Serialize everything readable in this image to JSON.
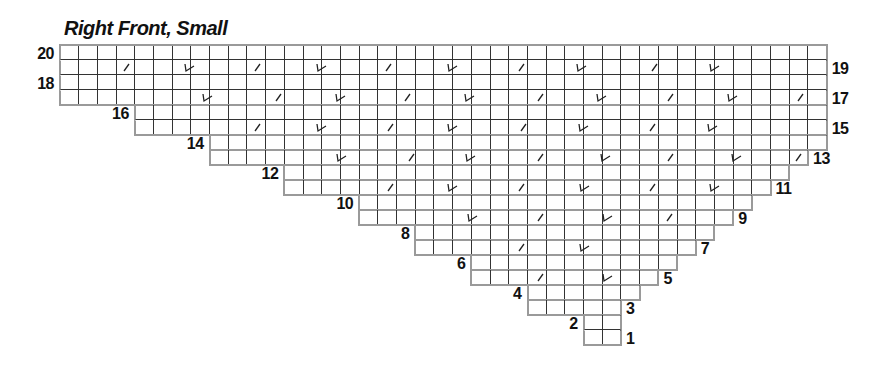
{
  "title": "Right Front, Small",
  "colors": {
    "grid_line": "#333333",
    "outline": "#9a9a9a",
    "symbol": "#222222",
    "text": "#111111"
  },
  "grid": {
    "origin_x": 60,
    "origin_y": 45,
    "cell_w": 18.7,
    "cell_h": 15,
    "columns": 41,
    "rows_count": 20,
    "rows": [
      {
        "row": 20,
        "start": 0,
        "end": 41,
        "label": "20",
        "label_side": "left"
      },
      {
        "row": 19,
        "start": 0,
        "end": 41,
        "label": "19",
        "label_side": "right"
      },
      {
        "row": 18,
        "start": 0,
        "end": 41,
        "label": "18",
        "label_side": "left"
      },
      {
        "row": 17,
        "start": 0,
        "end": 41,
        "label": "17",
        "label_side": "right"
      },
      {
        "row": 16,
        "start": 4,
        "end": 41,
        "label": "16",
        "label_side": "left"
      },
      {
        "row": 15,
        "start": 4,
        "end": 41,
        "label": "15",
        "label_side": "right"
      },
      {
        "row": 14,
        "start": 8,
        "end": 41,
        "label": "14",
        "label_side": "left"
      },
      {
        "row": 13,
        "start": 8,
        "end": 40,
        "label": "13",
        "label_side": "right"
      },
      {
        "row": 12,
        "start": 12,
        "end": 39,
        "label": "12",
        "label_side": "left"
      },
      {
        "row": 11,
        "start": 12,
        "end": 38,
        "label": "11",
        "label_side": "right"
      },
      {
        "row": 10,
        "start": 16,
        "end": 37,
        "label": "10",
        "label_side": "left"
      },
      {
        "row": 9,
        "start": 16,
        "end": 36,
        "label": "9",
        "label_side": "right"
      },
      {
        "row": 8,
        "start": 19,
        "end": 35,
        "label": "8",
        "label_side": "left"
      },
      {
        "row": 7,
        "start": 19,
        "end": 34,
        "label": "7",
        "label_side": "right"
      },
      {
        "row": 6,
        "start": 22,
        "end": 33,
        "label": "6",
        "label_side": "left"
      },
      {
        "row": 5,
        "start": 22,
        "end": 32,
        "label": "5",
        "label_side": "right"
      },
      {
        "row": 4,
        "start": 25,
        "end": 31,
        "label": "4",
        "label_side": "left"
      },
      {
        "row": 3,
        "start": 25,
        "end": 30,
        "label": "3",
        "label_side": "right"
      },
      {
        "row": 2,
        "start": 28,
        "end": 30,
        "label": "2",
        "label_side": "left"
      },
      {
        "row": 1,
        "start": 28,
        "end": 30,
        "label": "1",
        "label_side": "right"
      }
    ]
  },
  "legend_symbols": {
    "slash": "k2tog-slash",
    "check": "decrease-check"
  },
  "symbols": [
    {
      "row": 19,
      "col": 3.6,
      "type": "slash"
    },
    {
      "row": 19,
      "col": 6.95,
      "type": "check"
    },
    {
      "row": 19,
      "col": 10.6,
      "type": "slash"
    },
    {
      "row": 19,
      "col": 14.0,
      "type": "check"
    },
    {
      "row": 19,
      "col": 17.6,
      "type": "slash"
    },
    {
      "row": 19,
      "col": 21.0,
      "type": "check"
    },
    {
      "row": 19,
      "col": 24.7,
      "type": "slash"
    },
    {
      "row": 19,
      "col": 27.9,
      "type": "check"
    },
    {
      "row": 19,
      "col": 31.8,
      "type": "slash"
    },
    {
      "row": 19,
      "col": 35.0,
      "type": "check"
    },
    {
      "row": 17,
      "col": 7.9,
      "type": "check"
    },
    {
      "row": 17,
      "col": 11.7,
      "type": "slash"
    },
    {
      "row": 17,
      "col": 15.0,
      "type": "check"
    },
    {
      "row": 17,
      "col": 18.6,
      "type": "slash"
    },
    {
      "row": 17,
      "col": 21.9,
      "type": "check"
    },
    {
      "row": 17,
      "col": 25.7,
      "type": "slash"
    },
    {
      "row": 17,
      "col": 29.0,
      "type": "check"
    },
    {
      "row": 17,
      "col": 32.7,
      "type": "slash"
    },
    {
      "row": 17,
      "col": 36.0,
      "type": "check"
    },
    {
      "row": 17,
      "col": 39.6,
      "type": "slash"
    },
    {
      "row": 15,
      "col": 10.6,
      "type": "slash"
    },
    {
      "row": 15,
      "col": 14.0,
      "type": "check"
    },
    {
      "row": 15,
      "col": 17.7,
      "type": "slash"
    },
    {
      "row": 15,
      "col": 21.0,
      "type": "check"
    },
    {
      "row": 15,
      "col": 24.8,
      "type": "slash"
    },
    {
      "row": 15,
      "col": 28.0,
      "type": "check"
    },
    {
      "row": 15,
      "col": 31.7,
      "type": "slash"
    },
    {
      "row": 15,
      "col": 34.9,
      "type": "check"
    },
    {
      "row": 13,
      "col": 15.1,
      "type": "check"
    },
    {
      "row": 13,
      "col": 18.8,
      "type": "slash"
    },
    {
      "row": 13,
      "col": 22.0,
      "type": "check"
    },
    {
      "row": 13,
      "col": 25.7,
      "type": "slash"
    },
    {
      "row": 13,
      "col": 29.2,
      "type": "check"
    },
    {
      "row": 13,
      "col": 32.7,
      "type": "slash"
    },
    {
      "row": 13,
      "col": 36.2,
      "type": "check"
    },
    {
      "row": 13,
      "col": 39.5,
      "type": "slash"
    },
    {
      "row": 11,
      "col": 17.7,
      "type": "slash"
    },
    {
      "row": 11,
      "col": 21.0,
      "type": "check"
    },
    {
      "row": 11,
      "col": 24.7,
      "type": "slash"
    },
    {
      "row": 11,
      "col": 28.1,
      "type": "check"
    },
    {
      "row": 11,
      "col": 31.7,
      "type": "slash"
    },
    {
      "row": 11,
      "col": 35.0,
      "type": "check"
    },
    {
      "row": 9,
      "col": 22.1,
      "type": "check"
    },
    {
      "row": 9,
      "col": 25.7,
      "type": "slash"
    },
    {
      "row": 9,
      "col": 29.3,
      "type": "check"
    },
    {
      "row": 9,
      "col": 32.6,
      "type": "slash"
    },
    {
      "row": 7,
      "col": 24.7,
      "type": "slash"
    },
    {
      "row": 7,
      "col": 28.1,
      "type": "check"
    },
    {
      "row": 5,
      "col": 25.7,
      "type": "slash"
    },
    {
      "row": 5,
      "col": 29.3,
      "type": "check"
    }
  ]
}
